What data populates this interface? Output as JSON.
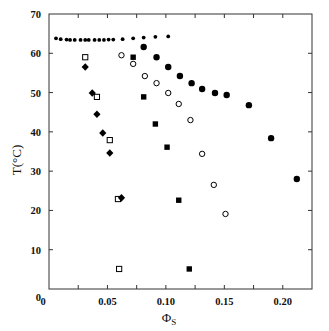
{
  "chart_data": {
    "type": "scatter",
    "title": "",
    "xlabel": "Φ",
    "xlabel_sub": "S",
    "ylabel": "T(°C)",
    "xlim": [
      0,
      0.225
    ],
    "ylim": [
      0,
      70
    ],
    "grid": false,
    "legend": null,
    "x_ticks": [
      0,
      0.05,
      0.1,
      0.15,
      0.2
    ],
    "x_tick_labels": [
      "0",
      "0.05",
      "0.10",
      "0.15",
      "0.20"
    ],
    "x_minor_ticks": [
      0.025,
      0.075,
      0.125,
      0.175
    ],
    "y_ticks": [
      0,
      10,
      20,
      30,
      40,
      50,
      60,
      70
    ],
    "y_tick_labels": [
      "0",
      "10",
      "20",
      "30",
      "40",
      "50",
      "60",
      "70"
    ],
    "series": [
      {
        "name": "small filled dots",
        "marker": "small-dot",
        "x": [
          0.006,
          0.01,
          0.015,
          0.018,
          0.022,
          0.027,
          0.031,
          0.034,
          0.039,
          0.043,
          0.047,
          0.051,
          0.055,
          0.063,
          0.072,
          0.081,
          0.091,
          0.102
        ],
        "y": [
          63.8,
          63.6,
          63.5,
          63.4,
          63.4,
          63.4,
          63.4,
          63.4,
          63.4,
          63.4,
          63.4,
          63.5,
          63.5,
          63.6,
          63.8,
          64.0,
          64.2,
          64.3
        ]
      },
      {
        "name": "filled circles",
        "marker": "filled-circle",
        "x": [
          0.081,
          0.092,
          0.102,
          0.112,
          0.122,
          0.131,
          0.142,
          0.152,
          0.171,
          0.19,
          0.212
        ],
        "y": [
          61.6,
          59.0,
          56.5,
          54.2,
          52.4,
          50.9,
          49.9,
          49.4,
          46.8,
          38.4,
          28.0
        ]
      },
      {
        "name": "open circles",
        "marker": "open-circle",
        "x": [
          0.062,
          0.072,
          0.082,
          0.092,
          0.102,
          0.111,
          0.121,
          0.131,
          0.141,
          0.151
        ],
        "y": [
          59.5,
          57.3,
          54.2,
          52.4,
          49.9,
          47.1,
          43.0,
          34.4,
          26.5,
          19.1
        ]
      },
      {
        "name": "filled squares",
        "marker": "filled-square",
        "x": [
          0.072,
          0.081,
          0.091,
          0.101,
          0.111,
          0.12
        ],
        "y": [
          59.0,
          48.9,
          42.0,
          36.1,
          22.6,
          5.1
        ]
      },
      {
        "name": "open squares",
        "marker": "open-square",
        "x": [
          0.031,
          0.041,
          0.052,
          0.059,
          0.06
        ],
        "y": [
          59.0,
          48.9,
          37.9,
          22.9,
          5.1
        ]
      },
      {
        "name": "filled diamonds",
        "marker": "filled-diamond",
        "x": [
          0.031,
          0.037,
          0.041,
          0.046,
          0.052,
          0.062
        ],
        "y": [
          56.5,
          49.9,
          44.5,
          39.7,
          34.6,
          23.2
        ]
      }
    ]
  },
  "colors": {
    "axis": "#333333",
    "marker": "#000000",
    "background": "#ffffff"
  }
}
